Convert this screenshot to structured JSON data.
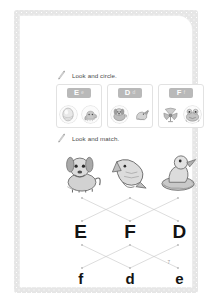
{
  "page": {
    "page_number": "7",
    "background_color": "#ffffff",
    "border_color": "#e6e6e6",
    "ink_color": "#4a4a4a"
  },
  "sections": [
    {
      "id": "look-and-circle",
      "icon": "pencil-icon",
      "instruction": "Look and circle."
    },
    {
      "id": "look-and-match",
      "icon": "pencil-icon",
      "instruction": "Look and match."
    }
  ],
  "circle_task": {
    "cards": [
      {
        "uppercase": "E",
        "lowercase": "e",
        "tag_color": "#b9b9b9",
        "pictures": [
          {
            "name": "egg-picture",
            "alt": "egg"
          },
          {
            "name": "elephant-picture",
            "alt": "elephant"
          }
        ]
      },
      {
        "uppercase": "D",
        "lowercase": "d",
        "tag_color": "#b9b9b9",
        "pictures": [
          {
            "name": "dog-picture",
            "alt": "dog"
          },
          {
            "name": "duck-picture",
            "alt": "duck"
          }
        ]
      },
      {
        "uppercase": "F",
        "lowercase": "f",
        "tag_color": "#b9b9b9",
        "pictures": [
          {
            "name": "fan-picture",
            "alt": "fan"
          },
          {
            "name": "frog-picture",
            "alt": "frog"
          }
        ]
      }
    ]
  },
  "match_task": {
    "pictures": [
      {
        "name": "dog-illustration",
        "alt": "dog"
      },
      {
        "name": "fish-illustration",
        "alt": "fish"
      },
      {
        "name": "duck-illustration",
        "alt": "duck"
      }
    ],
    "uppercase_letters": [
      "E",
      "F",
      "D"
    ],
    "lowercase_letters": [
      "f",
      "d",
      "e"
    ],
    "line_color": "#c0c0c0",
    "upper_connections": [
      {
        "from": 0,
        "to": 1
      },
      {
        "from": 1,
        "to": 0
      },
      {
        "from": 2,
        "to": 1
      },
      {
        "from": 1,
        "to": 2
      }
    ],
    "lower_connections": [
      {
        "from": 0,
        "to": 1
      },
      {
        "from": 1,
        "to": 0
      },
      {
        "from": 1,
        "to": 2
      },
      {
        "from": 2,
        "to": 1
      }
    ]
  }
}
